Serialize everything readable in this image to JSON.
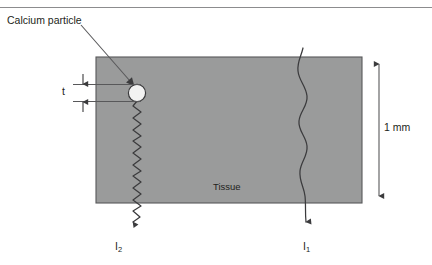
{
  "figure": {
    "domain": "scientific-diagram",
    "colors": {
      "tissue_fill": "#9a9b9b",
      "outline": "#58585a",
      "particle_fill": "#f2f2f2",
      "particle_stroke": "#3b3b3d",
      "text": "#231f20",
      "rule": "#8c8c8e",
      "background": "#ffffff"
    },
    "top_rule": {
      "present": true,
      "x1": 0,
      "x2": 432,
      "y": 7
    },
    "tissue_slab": {
      "label": "Tissue",
      "x": 96,
      "y": 57,
      "width": 266,
      "height": 146,
      "fill": "#9a9b9b",
      "stroke": "#58585a"
    },
    "particle": {
      "label": "Calcium particle",
      "cx": 137,
      "cy": 93,
      "r": 9,
      "fill": "#f2f2f2",
      "stroke": "#3b3b3d"
    },
    "leader": {
      "label": "Calcium particle",
      "from_x": 82,
      "from_y": 26,
      "to_x": 134,
      "to_y": 84
    },
    "thickness_dimension": {
      "label": "t",
      "top_y": 84,
      "bottom_y": 102,
      "arrow_x": 83,
      "extension_left_x": 73,
      "extension_right_x": 140
    },
    "depth_dimension": {
      "label": "1 mm",
      "x": 379,
      "top_y": 57,
      "bottom_y": 203
    },
    "beams": [
      {
        "name": "beam-through-particle",
        "label": "I",
        "subscript": "2",
        "label_x": 115,
        "label_y": 241,
        "start_x": 137,
        "start_y": 102,
        "end_x": 131,
        "end_y": 235,
        "wave_amplitude": 4.2,
        "wave_period": 11,
        "style": "tight-zigzag",
        "description": "attenuated beam passing through calcium particle then tissue"
      },
      {
        "name": "beam-through-tissue",
        "label": "I",
        "subscript": "1",
        "label_x": 303,
        "label_y": 241,
        "start_x": 303,
        "start_y": 48,
        "end_x": 306,
        "end_y": 235,
        "wave_amplitude": 6.5,
        "wave_period": 38,
        "style": "smooth-sine",
        "description": "reference beam passing through tissue only"
      }
    ]
  }
}
